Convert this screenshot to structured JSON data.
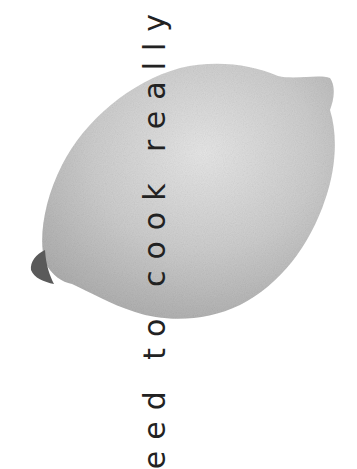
{
  "image": {
    "subject": "lemon",
    "background_color": "#ffffff",
    "lemon_color": "#c9c9c9",
    "lemon_highlight": "#e4e4e4",
    "lemon_shadow": "#9a9a9a",
    "stem_color": "#555555"
  },
  "caption": {
    "text": "eed to cook really w",
    "color": "#222222",
    "orientation": "rotated -90deg, reading bottom to top"
  }
}
